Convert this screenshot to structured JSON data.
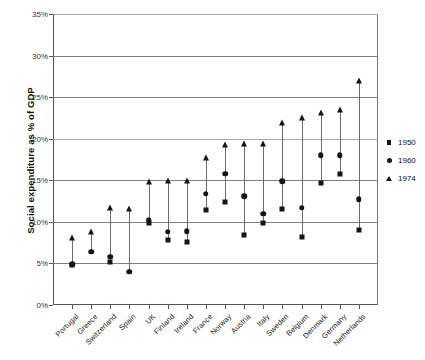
{
  "chart_data": {
    "type": "scatter",
    "title": "",
    "xlabel": "",
    "ylabel": "Social expenditure as % of GDP",
    "ylim": [
      0,
      35
    ],
    "ytick_labels": [
      "0%",
      "5%",
      "10%",
      "15%",
      "20%",
      "25%",
      "30%",
      "35%"
    ],
    "ytick_values": [
      0,
      5,
      10,
      15,
      20,
      25,
      30,
      35
    ],
    "grid": "horizontal",
    "legend_position": "right",
    "categories": [
      "Portugal",
      "Greece",
      "Switzerland",
      "Spain",
      "UK",
      "Finland",
      "Ireland",
      "France",
      "Norway",
      "Austria",
      "Italy",
      "Sweden",
      "Belgium",
      "Denmark",
      "Germany",
      "Netherlands"
    ],
    "series": [
      {
        "name": "1950",
        "marker": "square",
        "values": [
          4.8,
          null,
          5.2,
          null,
          9.9,
          7.8,
          7.6,
          11.4,
          12.4,
          8.4,
          9.9,
          11.6,
          8.2,
          14.7,
          15.7,
          9.0
        ]
      },
      {
        "name": "1960",
        "marker": "circle",
        "values": [
          4.9,
          6.4,
          5.8,
          4.0,
          10.2,
          8.8,
          8.9,
          13.4,
          15.8,
          13.1,
          11.0,
          14.9,
          11.7,
          18.0,
          18.0,
          12.7
        ]
      },
      {
        "name": "1974",
        "marker": "triangle",
        "values": [
          8.1,
          8.8,
          11.7,
          11.6,
          14.8,
          14.9,
          14.9,
          17.7,
          19.3,
          19.4,
          19.4,
          21.9,
          22.5,
          23.1,
          23.4,
          26.9
        ]
      }
    ]
  },
  "legend": {
    "items": [
      {
        "label": "1950",
        "marker": "square-marker"
      },
      {
        "label": "1960",
        "marker": "circle-marker"
      },
      {
        "label": "1974",
        "marker": "triangle-marker"
      }
    ]
  }
}
